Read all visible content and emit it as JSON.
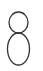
{
  "glyph": {
    "character": "8",
    "icon": "digit-eight",
    "stroke_color": "#333333",
    "background": "#ffffff"
  }
}
